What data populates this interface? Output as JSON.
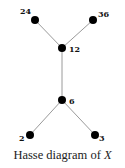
{
  "diagram": {
    "title": "Hasse diagram of X",
    "caption_prefix": "Hasse diagram of ",
    "caption_var": "X",
    "node_color": "#000000",
    "edge_color": "#9a9a9a",
    "nodes": [
      {
        "id": "24",
        "label": "24",
        "x": 35,
        "y": 20
      },
      {
        "id": "36",
        "label": "36",
        "x": 93,
        "y": 20
      },
      {
        "id": "12",
        "label": "12",
        "x": 62,
        "y": 48
      },
      {
        "id": "6",
        "label": "6",
        "x": 62,
        "y": 100
      },
      {
        "id": "2",
        "label": "2",
        "x": 30,
        "y": 135
      },
      {
        "id": "3",
        "label": "3",
        "x": 95,
        "y": 135
      }
    ],
    "edges": [
      {
        "from": "24",
        "to": "12"
      },
      {
        "from": "36",
        "to": "12"
      },
      {
        "from": "12",
        "to": "6"
      },
      {
        "from": "6",
        "to": "2"
      },
      {
        "from": "6",
        "to": "3"
      }
    ]
  }
}
